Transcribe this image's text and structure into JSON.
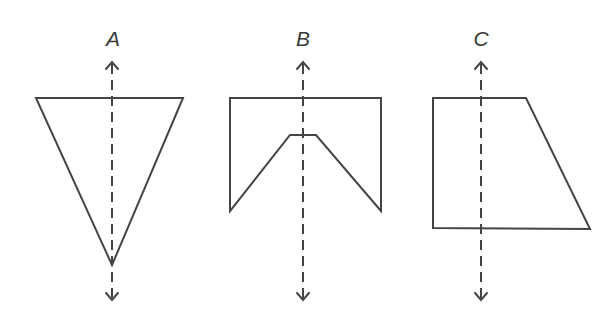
{
  "diagram": {
    "colors": {
      "stroke": "#444444",
      "label": "#3a3a3a",
      "background": "#ffffff"
    },
    "figures": [
      {
        "label": "A",
        "shape": "inverted triangle",
        "points": "36,98 183,98 112,265",
        "axis_x": 112,
        "axis_top": 62,
        "axis_bottom": 300,
        "label_x": 113,
        "label_y": 46
      },
      {
        "label": "B",
        "shape": "pentagon-notched rectangle",
        "points": "230,98 381,98 381,211 316,135 290,135 230,211",
        "axis_x": 303,
        "axis_top": 62,
        "axis_bottom": 300,
        "label_x": 303,
        "label_y": 46
      },
      {
        "label": "C",
        "shape": "right trapezoid",
        "points": "433,98 526,98 590,229 433,228",
        "axis_x": 481,
        "axis_top": 62,
        "axis_bottom": 300,
        "label_x": 481,
        "label_y": 46
      }
    ]
  }
}
